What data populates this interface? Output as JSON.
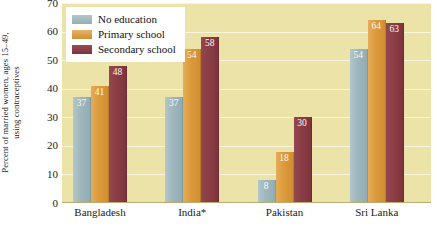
{
  "chart_data": {
    "type": "bar",
    "title": "",
    "subtitle": "",
    "xlabel": "",
    "ylabel": "Percent of married women, ages 15–49, using contraceptives",
    "ylabel_line1": "Percent of married women, ages 15–49,",
    "ylabel_line2": "using contraceptives",
    "categories": [
      "Bangladesh",
      "India*",
      "Pakistan",
      "Sri Lanka"
    ],
    "series": [
      {
        "name": "No education",
        "color": "#9fb7bd",
        "values": [
          37,
          37,
          8,
          54
        ]
      },
      {
        "name": "Primary school",
        "color": "#dc9a3c",
        "values": [
          41,
          54,
          18,
          64
        ]
      },
      {
        "name": "Secondary school",
        "color": "#8b3d45",
        "values": [
          48,
          58,
          30,
          63
        ]
      }
    ],
    "ylim": [
      0,
      70
    ],
    "yticks": [
      0,
      10,
      20,
      30,
      40,
      50,
      60,
      70
    ],
    "ytick_labels": [
      "0",
      "10",
      "20",
      "30",
      "40",
      "50",
      "60",
      "70"
    ],
    "grid": true,
    "legend_position": "top-left",
    "plot_background": "#ece3a8",
    "data_labels": true
  },
  "legend": {
    "items": [
      {
        "label": "No education"
      },
      {
        "label": "Primary school"
      },
      {
        "label": "Secondary school"
      }
    ]
  }
}
